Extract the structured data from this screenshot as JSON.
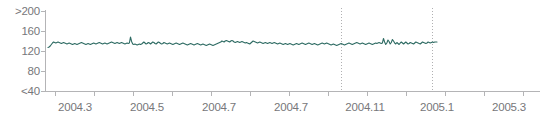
{
  "chart_data": {
    "type": "line",
    "title": "",
    "xlabel": "",
    "ylabel": "",
    "ylim": [
      40,
      200
    ],
    "xlim": [
      2004.25,
      2005.4
    ],
    "grid": false,
    "legend": null,
    "y_tick_labels": [
      ">200",
      "160",
      "120",
      "80",
      "<40"
    ],
    "y_tick_values": [
      200,
      160,
      120,
      80,
      40
    ],
    "x_tick_labels": [
      "2004.3",
      "2004.5",
      "2004.7",
      "2004.7",
      "2004.11",
      "2005.1",
      "2005.3"
    ],
    "x_tick_values": [
      2004.3,
      2004.5,
      2004.7,
      2004.9,
      2004.11,
      2005.1,
      2005.3
    ],
    "annotations": [
      {
        "name": "vertical-dotted-line-1",
        "x": 2004.11
      },
      {
        "name": "vertical-dotted-line-2",
        "x": 2005.1
      }
    ],
    "series": [
      {
        "name": "series-1",
        "color": "#2e6b63",
        "values": [
          127,
          128,
          130,
          133,
          136,
          138,
          137,
          136,
          137,
          138,
          137,
          136,
          135,
          136,
          137,
          136,
          135,
          134,
          135,
          136,
          135,
          134,
          133,
          134,
          135,
          134,
          133,
          134,
          135,
          136,
          137,
          136,
          135,
          134,
          133,
          134,
          135,
          134,
          133,
          134,
          135,
          136,
          135,
          134,
          135,
          136,
          137,
          136,
          135,
          134,
          135,
          136,
          135,
          134,
          135,
          136,
          137,
          138,
          137,
          136,
          135,
          136,
          137,
          136,
          135,
          136,
          137,
          136,
          135,
          134,
          135,
          136,
          135,
          136,
          148,
          139,
          134,
          133,
          134,
          133,
          132,
          133,
          134,
          133,
          134,
          136,
          138,
          136,
          134,
          135,
          137,
          136,
          134,
          136,
          138,
          137,
          135,
          134,
          136,
          138,
          137,
          135,
          134,
          135,
          137,
          136,
          135,
          134,
          135,
          136,
          135,
          134,
          133,
          134,
          135,
          136,
          135,
          134,
          133,
          134,
          135,
          136,
          135,
          134,
          133,
          132,
          133,
          134,
          135,
          134,
          133,
          132,
          133,
          134,
          135,
          134,
          133,
          132,
          133,
          134,
          133,
          132,
          131,
          132,
          133,
          134,
          133,
          132,
          131,
          132,
          133,
          134,
          135,
          136,
          137,
          138,
          140,
          139,
          138,
          140,
          141,
          140,
          139,
          138,
          140,
          141,
          140,
          138,
          137,
          138,
          139,
          138,
          137,
          138,
          139,
          138,
          137,
          136,
          137,
          136,
          135,
          134,
          136,
          138,
          140,
          139,
          138,
          137,
          136,
          137,
          138,
          137,
          136,
          135,
          136,
          137,
          136,
          135,
          136,
          137,
          136,
          135,
          136,
          137,
          136,
          135,
          134,
          135,
          136,
          135,
          134,
          133,
          134,
          135,
          134,
          133,
          134,
          135,
          134,
          133,
          132,
          133,
          134,
          135,
          134,
          133,
          134,
          135,
          136,
          135,
          134,
          133,
          134,
          135,
          136,
          135,
          134,
          133,
          134,
          135,
          134,
          133,
          132,
          133,
          134,
          135,
          136,
          135,
          134,
          135,
          136,
          135,
          134,
          133,
          132,
          133,
          134,
          133,
          132,
          131,
          132,
          133,
          134,
          135,
          134,
          133,
          132,
          133,
          134,
          135,
          136,
          135,
          134,
          133,
          134,
          135,
          136,
          137,
          136,
          135,
          134,
          135,
          136,
          135,
          134,
          133,
          134,
          135,
          136,
          135,
          134,
          133,
          134,
          135,
          136,
          135,
          136,
          137,
          136,
          135,
          136,
          145,
          138,
          133,
          136,
          142,
          139,
          134,
          137,
          143,
          140,
          136,
          134,
          137,
          135,
          133,
          136,
          138,
          136,
          134,
          136,
          138,
          136,
          134,
          135,
          137,
          136,
          135,
          134,
          136,
          138,
          137,
          136,
          135,
          134,
          136,
          138,
          137,
          136,
          135,
          136,
          138,
          137,
          136,
          137,
          138,
          137,
          138,
          138,
          138
        ]
      }
    ]
  }
}
